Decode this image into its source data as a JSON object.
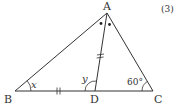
{
  "problem_number": "(3)",
  "points": {
    "A": {
      "label": "A",
      "x": 107,
      "y": 13
    },
    "B": {
      "label": "B",
      "x": 15,
      "y": 91
    },
    "C": {
      "label": "C",
      "x": 153,
      "y": 91
    },
    "D": {
      "label": "D",
      "x": 95,
      "y": 91
    }
  },
  "angles": {
    "B": "x",
    "ADB": "y",
    "C": "60°"
  },
  "markers": {
    "equal_segments": [
      "BD",
      "AD"
    ],
    "bisected_angle": "A"
  },
  "colors": {
    "stroke": "#333333",
    "background": "#ffffff"
  }
}
